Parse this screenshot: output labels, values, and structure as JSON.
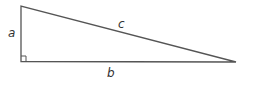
{
  "diagram": {
    "type": "right-triangle",
    "vertices": {
      "top": [
        21,
        6
      ],
      "right_angle": [
        21,
        61
      ],
      "right": [
        236,
        62
      ]
    },
    "labels": {
      "a": "a",
      "b": "b",
      "c": "c"
    },
    "right_angle_marker": true,
    "line_color": "#555555",
    "label_color": "#333333"
  }
}
